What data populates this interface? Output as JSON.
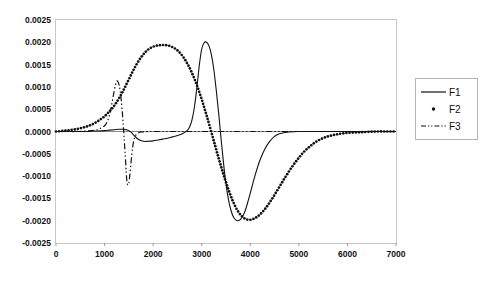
{
  "chart_data": {
    "type": "line",
    "title": "",
    "xlabel": "",
    "ylabel": "",
    "xlim": [
      0,
      7000
    ],
    "ylim": [
      -0.0025,
      0.0025
    ],
    "grid": false,
    "legend_position": "right",
    "x_ticks": [
      "0",
      "1000",
      "2000",
      "3000",
      "4000",
      "5000",
      "6000",
      "7000"
    ],
    "x_tick_values": [
      0,
      1000,
      2000,
      3000,
      4000,
      5000,
      6000,
      7000
    ],
    "y_ticks": [
      "0.0025",
      "0.0020",
      "0.0015",
      "0.0010",
      "0.0005",
      "0.0000",
      "-0.0005",
      "-0.0010",
      "-0.0015",
      "-0.0020",
      "-0.0025"
    ],
    "y_tick_values": [
      0.0025,
      0.002,
      0.0015,
      0.001,
      0.0005,
      0.0,
      -0.0005,
      -0.001,
      -0.0015,
      -0.002,
      -0.0025
    ],
    "series": [
      {
        "name": "F1",
        "style": "solid-line",
        "color": "#111111",
        "x": [
          0,
          200,
          400,
          600,
          800,
          1000,
          1100,
          1200,
          1300,
          1400,
          1450,
          1500,
          1550,
          1600,
          1700,
          1800,
          1900,
          2000,
          2100,
          2200,
          2300,
          2400,
          2500,
          2600,
          2700,
          2750,
          2800,
          2850,
          2900,
          2950,
          3000,
          3050,
          3100,
          3150,
          3200,
          3250,
          3300,
          3350,
          3400,
          3450,
          3500,
          3550,
          3600,
          3650,
          3700,
          3750,
          3800,
          3850,
          3900,
          3950,
          4000,
          4100,
          4200,
          4300,
          4400,
          4500,
          4600,
          4800,
          5000,
          5500,
          6000,
          6500,
          7000
        ],
        "y": [
          0.0,
          0.0,
          0.0,
          0.0,
          1e-05,
          2e-05,
          3e-05,
          4e-05,
          5e-05,
          5e-05,
          4e-05,
          2e-05,
          -2e-05,
          -8e-05,
          -0.00018,
          -0.00022,
          -0.00022,
          -0.00021,
          -0.00019,
          -0.00017,
          -0.00015,
          -0.00012,
          -9e-05,
          -5e-05,
          2e-05,
          0.0001,
          0.00026,
          0.00055,
          0.00098,
          0.00148,
          0.00185,
          0.00199,
          0.002,
          0.00192,
          0.00172,
          0.00138,
          0.00092,
          0.0004,
          -0.00018,
          -0.00072,
          -0.00118,
          -0.00152,
          -0.00176,
          -0.00191,
          -0.00198,
          -0.002,
          -0.00197,
          -0.00189,
          -0.00176,
          -0.00158,
          -0.00138,
          -0.00098,
          -0.00064,
          -0.00039,
          -0.00022,
          -0.00011,
          -5e-05,
          -1e-05,
          0.0,
          0.0,
          0.0,
          0.0,
          0.0
        ]
      },
      {
        "name": "F2",
        "style": "dotted-markers",
        "color": "#111111",
        "x": [
          0,
          200,
          400,
          600,
          700,
          800,
          900,
          1000,
          1100,
          1200,
          1300,
          1400,
          1500,
          1600,
          1700,
          1800,
          1900,
          2000,
          2100,
          2200,
          2300,
          2400,
          2500,
          2600,
          2700,
          2800,
          2900,
          3000,
          3100,
          3200,
          3300,
          3400,
          3500,
          3600,
          3700,
          3800,
          3900,
          4000,
          4100,
          4200,
          4300,
          4400,
          4500,
          4600,
          4700,
          4800,
          4900,
          5000,
          5100,
          5200,
          5300,
          5400,
          5500,
          5600,
          5800,
          6000,
          6200,
          6400,
          6600,
          6800,
          7000
        ],
        "y": [
          0.0,
          2e-05,
          5e-05,
          0.0001,
          0.00014,
          0.00019,
          0.00026,
          0.00034,
          0.00045,
          0.00058,
          0.00075,
          0.00095,
          0.00117,
          0.00139,
          0.00158,
          0.00173,
          0.00184,
          0.0019,
          0.00193,
          0.00194,
          0.00193,
          0.00189,
          0.00182,
          0.0017,
          0.00153,
          0.00131,
          0.00104,
          0.00072,
          0.00036,
          -2e-05,
          -0.00041,
          -0.00079,
          -0.00114,
          -0.00145,
          -0.0017,
          -0.00187,
          -0.00196,
          -0.00198,
          -0.00194,
          -0.00186,
          -0.00174,
          -0.00159,
          -0.00142,
          -0.00124,
          -0.00106,
          -0.00089,
          -0.00073,
          -0.00059,
          -0.00046,
          -0.00036,
          -0.00027,
          -0.0002,
          -0.00015,
          -0.00011,
          -6e-05,
          -3e-05,
          -2e-05,
          -1e-05,
          0.0,
          0.0,
          0.0
        ]
      },
      {
        "name": "F3",
        "style": "dash-dot-line",
        "color": "#111111",
        "x": [
          0,
          200,
          400,
          600,
          800,
          900,
          1000,
          1050,
          1100,
          1150,
          1200,
          1240,
          1270,
          1300,
          1320,
          1340,
          1360,
          1380,
          1400,
          1420,
          1440,
          1450,
          1460,
          1480,
          1500,
          1520,
          1540,
          1560,
          1580,
          1600,
          1620,
          1650,
          1700,
          1750,
          1800,
          1900,
          2000,
          2200,
          2500,
          3000,
          3500,
          4000,
          5000,
          6000,
          7000
        ],
        "y": [
          0.0,
          0.0,
          0.0,
          1e-05,
          3e-05,
          6e-05,
          0.00013,
          0.00021,
          0.00036,
          0.00062,
          0.00092,
          0.0011,
          0.00113,
          0.00104,
          0.00092,
          0.00074,
          0.0005,
          0.00022,
          -0.0001,
          -0.00044,
          -0.0008,
          -0.00098,
          -0.00112,
          -0.0012,
          -0.00115,
          -0.00098,
          -0.00075,
          -0.00052,
          -0.00034,
          -0.00021,
          -0.00013,
          -7e-05,
          -3e-05,
          -1e-05,
          -1e-05,
          0.0,
          0.0,
          0.0,
          0.0,
          0.0,
          0.0,
          0.0,
          0.0,
          0.0,
          0.0
        ]
      }
    ]
  },
  "legend": {
    "entries": [
      {
        "label": "F1",
        "style": "solid-line"
      },
      {
        "label": "F2",
        "style": "dot-marker"
      },
      {
        "label": "F3",
        "style": "dash-dot-line"
      }
    ]
  },
  "colors": {
    "plot_background": "#ffffff",
    "frame": "#c8c8c8",
    "axis_zero_line": "#8a8a8a",
    "series_ink": "#111111",
    "legend_border": "#b4b4b4",
    "text": "#111111"
  }
}
